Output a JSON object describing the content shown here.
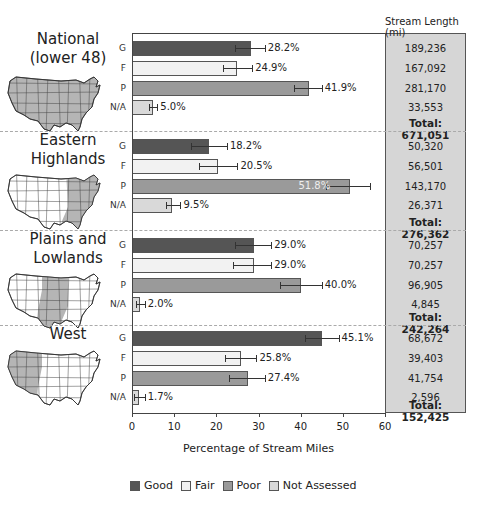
{
  "chart_data": {
    "type": "bar",
    "orientation": "horizontal",
    "xlabel": "Percentage of Stream Miles",
    "xlim": [
      0,
      60
    ],
    "xticks": [
      0,
      10,
      20,
      30,
      40,
      50,
      60
    ],
    "categories": [
      "G",
      "F",
      "P",
      "N/A"
    ],
    "legend": [
      {
        "key": "G",
        "label": "Good",
        "color": "#555555"
      },
      {
        "key": "F",
        "label": "Fair",
        "color": "#f2f2f2"
      },
      {
        "key": "P",
        "label": "Poor",
        "color": "#9a9a9a"
      },
      {
        "key": "N/A",
        "label": "Not Assessed",
        "color": "#d9d9d9"
      }
    ],
    "side_panel_title": "Stream Length (mi)",
    "regions": [
      {
        "name": "National (lower 48)",
        "title_lines": [
          "National",
          "(lower 48)"
        ],
        "values": [
          28.2,
          24.9,
          41.9,
          5.0
        ],
        "labels": [
          "28.2%",
          "24.9%",
          "41.9%",
          "5.0%"
        ],
        "err_low": [
          24.5,
          21.5,
          38.5,
          4.0
        ],
        "err_high": [
          31.5,
          28.5,
          45.0,
          6.0
        ],
        "stream_length": [
          "189,236",
          "167,092",
          "281,170",
          "33,553"
        ],
        "total": "Total: 671,051"
      },
      {
        "name": "Eastern Highlands",
        "title_lines": [
          "Eastern",
          "Highlands"
        ],
        "values": [
          18.2,
          20.5,
          51.8,
          9.5
        ],
        "labels": [
          "18.2%",
          "20.5%",
          "51.8%",
          "9.5%"
        ],
        "err_low": [
          14.0,
          16.0,
          46.0,
          8.0
        ],
        "err_high": [
          22.5,
          25.0,
          56.5,
          11.5
        ],
        "stream_length": [
          "50,320",
          "56,501",
          "143,170",
          "26,371"
        ],
        "total": "Total: 276,362"
      },
      {
        "name": "Plains and Lowlands",
        "title_lines": [
          "Plains and",
          "Lowlands"
        ],
        "values": [
          29.0,
          29.0,
          40.0,
          2.0
        ],
        "labels": [
          "29.0%",
          "29.0%",
          "40.0%",
          "2.0%"
        ],
        "err_low": [
          24.5,
          24.0,
          35.0,
          1.0
        ],
        "err_high": [
          33.0,
          33.0,
          45.0,
          3.0
        ],
        "stream_length": [
          "70,257",
          "70,257",
          "96,905",
          "4,845"
        ],
        "total": "Total: 242,264"
      },
      {
        "name": "West",
        "title_lines": [
          "West",
          ""
        ],
        "values": [
          45.1,
          25.8,
          27.4,
          1.7
        ],
        "labels": [
          "45.1%",
          "25.8%",
          "27.4%",
          "1.7%"
        ],
        "err_low": [
          41.0,
          22.0,
          23.0,
          0.5
        ],
        "err_high": [
          49.0,
          29.5,
          31.5,
          3.0
        ],
        "stream_length": [
          "68,672",
          "39,403",
          "41,754",
          "2,596"
        ],
        "total": "Total: 152,425"
      }
    ]
  }
}
